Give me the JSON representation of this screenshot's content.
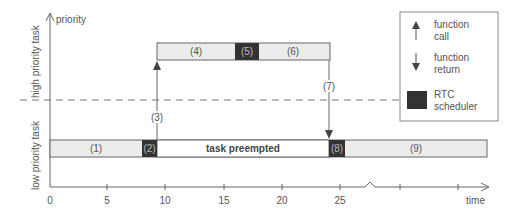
{
  "diagram": {
    "y_axis_label": "priority",
    "x_axis_label": "time",
    "lane_labels": {
      "high": "high priority task",
      "low": "low priority task"
    },
    "x_ticks": [
      "0",
      "5",
      "10",
      "15",
      "20",
      "25"
    ],
    "segments": {
      "s1": "(1)",
      "s2": "(2)",
      "s3": "(3)",
      "s4": "(4)",
      "s5": "(5)",
      "s6": "(6)",
      "s7": "(7)",
      "s8": "(8)",
      "s9": "(9)"
    },
    "preempted_label": "task preempted",
    "legend": {
      "call_line1": "function",
      "call_line2": "call",
      "return_line1": "function",
      "return_line2": "return",
      "rtc_line1": "RTC",
      "rtc_line2": "scheduler"
    },
    "colors": {
      "task_fill": "#ebebeb",
      "scheduler_fill": "#333333",
      "line": "#666666",
      "text": "#555555"
    }
  }
}
